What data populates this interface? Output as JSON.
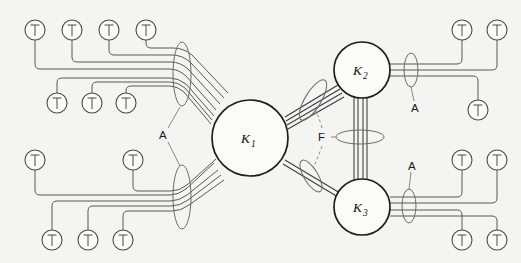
{
  "figure": {
    "background_color": "#f4f4f2",
    "line_color": "#58585a",
    "node_outline_color": "#1e1e1e",
    "width": 521,
    "height": 263
  },
  "nodes": [
    {
      "id": "K1",
      "letter": "K",
      "subscript": "1",
      "cx": 250,
      "cy": 138,
      "r": 38
    },
    {
      "id": "K2",
      "letter": "K",
      "subscript": "2",
      "cx": 362,
      "cy": 70,
      "r": 28
    },
    {
      "id": "K3",
      "letter": "K",
      "subscript": "3",
      "cx": 362,
      "cy": 207,
      "r": 28
    }
  ],
  "group_labels": [
    {
      "id": "A-left",
      "text": "A",
      "x": 164,
      "y": 135
    },
    {
      "id": "A-upper-right",
      "text": "A",
      "x": 416,
      "y": 108
    },
    {
      "id": "A-lower-right",
      "text": "A",
      "x": 413,
      "y": 166
    },
    {
      "id": "F-center",
      "text": "F",
      "x": 323,
      "y": 137
    }
  ],
  "terminals": {
    "symbol": "T",
    "radius": 10,
    "upper_left": [
      {
        "cx": 35,
        "cy": 30
      },
      {
        "cx": 72,
        "cy": 30
      },
      {
        "cx": 109,
        "cy": 30
      },
      {
        "cx": 146,
        "cy": 30
      },
      {
        "cx": 57,
        "cy": 103
      },
      {
        "cx": 92,
        "cy": 103
      },
      {
        "cx": 126,
        "cy": 103
      }
    ],
    "lower_left": [
      {
        "cx": 35,
        "cy": 160
      },
      {
        "cx": 133,
        "cy": 160
      },
      {
        "cx": 52,
        "cy": 240
      },
      {
        "cx": 88,
        "cy": 240
      },
      {
        "cx": 123,
        "cy": 240
      }
    ],
    "upper_right": [
      {
        "cx": 462,
        "cy": 30
      },
      {
        "cx": 497,
        "cy": 30
      },
      {
        "cx": 478,
        "cy": 110
      }
    ],
    "lower_right": [
      {
        "cx": 462,
        "cy": 160
      },
      {
        "cx": 497,
        "cy": 160
      },
      {
        "cx": 462,
        "cy": 240
      },
      {
        "cx": 497,
        "cy": 240
      }
    ]
  },
  "bundles": {
    "upper_left_to_k1": {
      "line_count": 7,
      "label": "A"
    },
    "lower_left_to_k1": {
      "line_count": 5,
      "label": "A"
    },
    "k1_to_k2": {
      "line_count": 4,
      "label": "F"
    },
    "k1_to_k3": {
      "line_count": 2,
      "label": "F"
    },
    "k2_to_k3": {
      "line_count": 4,
      "label": "F"
    },
    "k2_to_right": {
      "line_count": 3,
      "label": "A"
    },
    "k3_to_right": {
      "line_count": 4,
      "label": "A"
    }
  }
}
